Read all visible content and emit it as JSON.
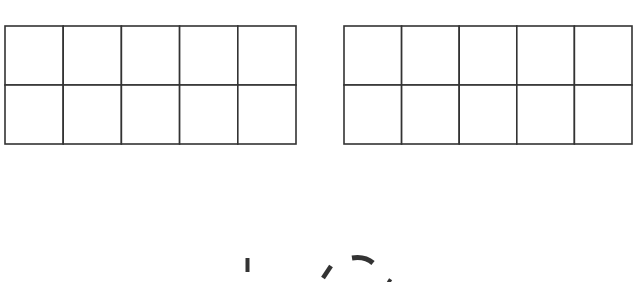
{
  "diagram": {
    "type": "ten-frames",
    "stroke_color": "#333333",
    "background": "#ffffff",
    "frames": [
      {
        "name": "left-ten-frame",
        "rows": 2,
        "cols": 5,
        "x": 5,
        "y": 26,
        "width": 291,
        "height": 118,
        "filled_cells": 0
      },
      {
        "name": "right-ten-frame",
        "rows": 2,
        "cols": 5,
        "x": 344,
        "y": 26,
        "width": 288,
        "height": 118,
        "filled_cells": 0
      }
    ],
    "cropped_glyphs_note": "partially visible marks at bottom edge"
  }
}
